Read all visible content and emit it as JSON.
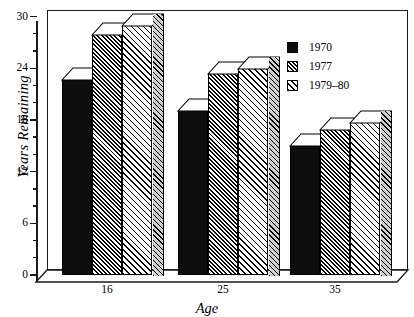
{
  "chart_data": {
    "type": "bar",
    "title": "",
    "xlabel": "Age",
    "ylabel": "Years Remaining",
    "categories": [
      "16",
      "25",
      "35"
    ],
    "series": [
      {
        "name": "1970",
        "values": [
          22.7,
          19.2,
          15.1
        ]
      },
      {
        "name": "1977",
        "values": [
          28.0,
          23.5,
          16.9
        ]
      },
      {
        "name": "1979–80",
        "values": [
          29.0,
          24.0,
          17.8
        ]
      }
    ],
    "ylim": [
      0,
      30
    ],
    "yticks": [
      0,
      6,
      12,
      18,
      24,
      30
    ],
    "ytick_labels": [
      "0",
      "6",
      "12",
      "18",
      "24",
      "30"
    ],
    "minor_tick_step": 2,
    "grid": false,
    "legend_position": "top-right",
    "style": "3d-bar-chart"
  },
  "axes": {
    "y_title": "Years Remaining",
    "x_title": "Age",
    "y_tick_labels": [
      "30",
      "24",
      "18",
      "12",
      "6",
      "0"
    ],
    "x_tick_labels": [
      "16",
      "25",
      "35"
    ]
  },
  "legend": {
    "items": [
      {
        "label": "1970",
        "swatch": "solid-black-swatch"
      },
      {
        "label": "1977",
        "swatch": "dark-hatch-swatch"
      },
      {
        "label": "1979–80",
        "swatch": "light-hatch-swatch"
      }
    ]
  },
  "colors": {
    "ink": "#000000",
    "series_1970": "#0d0d0d",
    "series_1977": "#3a3a3a",
    "series_1979_80": "#c9c9c9",
    "background": "#ffffff"
  }
}
